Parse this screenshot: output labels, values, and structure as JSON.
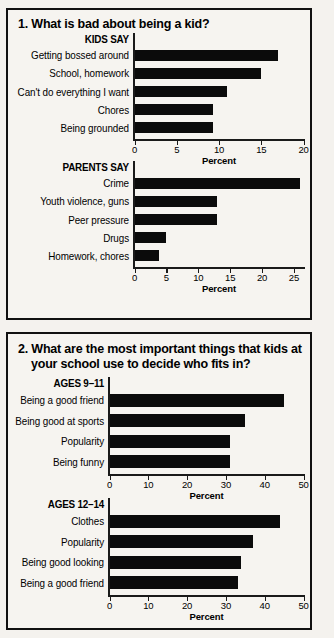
{
  "panels": [
    {
      "id": "panel-1",
      "title": "1. What is bad about being a kid?",
      "title_line2": "",
      "charts": [
        {
          "group": "KIDS SAY",
          "xlabel": "Percent",
          "ticks": [
            "0",
            "5",
            "10",
            "15",
            "20"
          ],
          "xmax": 20,
          "bars": [
            {
              "label": "Getting bossed around",
              "value": 17
            },
            {
              "label": "School, homework",
              "value": 15
            },
            {
              "label": "Can't do everything I want",
              "value": 11
            },
            {
              "label": "Chores",
              "value": 9.3
            },
            {
              "label": "Being grounded",
              "value": 9.3
            }
          ]
        },
        {
          "group": "PARENTS SAY",
          "xlabel": "Percent",
          "ticks": [
            "0",
            "5",
            "10",
            "15",
            "20",
            "25"
          ],
          "xmax": 26.5,
          "bars": [
            {
              "label": "Crime",
              "value": 26
            },
            {
              "label": "Youth violence, guns",
              "value": 13
            },
            {
              "label": "Peer pressure",
              "value": 13
            },
            {
              "label": "Drugs",
              "value": 5
            },
            {
              "label": "Homework, chores",
              "value": 3.8
            }
          ]
        }
      ]
    },
    {
      "id": "panel-2",
      "title": "2. What are the most important things that kids at",
      "title_line2": "your school use to decide who fits in?",
      "charts": [
        {
          "group": "AGES 9–11",
          "xlabel": "Percent",
          "ticks": [
            "0",
            "10",
            "20",
            "30",
            "40",
            "50"
          ],
          "xmax": 50,
          "bars": [
            {
              "label": "Being a good friend",
              "value": 45
            },
            {
              "label": "Being good at sports",
              "value": 35
            },
            {
              "label": "Popularity",
              "value": 31
            },
            {
              "label": "Being funny",
              "value": 31
            }
          ]
        },
        {
          "group": "AGES 12–14",
          "xlabel": "Percent",
          "ticks": [
            "0",
            "10",
            "20",
            "30",
            "40",
            "50"
          ],
          "xmax": 50,
          "bars": [
            {
              "label": "Clothes",
              "value": 44
            },
            {
              "label": "Popularity",
              "value": 37
            },
            {
              "label": "Being good looking",
              "value": 34
            },
            {
              "label": "Being a good friend",
              "value": 33
            }
          ]
        }
      ]
    }
  ],
  "chart_data": [
    {
      "type": "bar",
      "orientation": "horizontal",
      "title": "1. What is bad about being a kid? — KIDS SAY",
      "categories": [
        "Getting bossed around",
        "School, homework",
        "Can't do everything I want",
        "Chores",
        "Being grounded"
      ],
      "values": [
        17,
        15,
        11,
        9.3,
        9.3
      ],
      "xlabel": "Percent",
      "ylabel": "",
      "xlim": [
        0,
        20
      ],
      "xticks": [
        0,
        5,
        10,
        15,
        20
      ],
      "grid": false,
      "legend": "none"
    },
    {
      "type": "bar",
      "orientation": "horizontal",
      "title": "1. What is bad about being a kid? — PARENTS SAY",
      "categories": [
        "Crime",
        "Youth violence, guns",
        "Peer pressure",
        "Drugs",
        "Homework, chores"
      ],
      "values": [
        26,
        13,
        13,
        5,
        3.8
      ],
      "xlabel": "Percent",
      "ylabel": "",
      "xlim": [
        0,
        26.5
      ],
      "xticks": [
        0,
        5,
        10,
        15,
        20,
        25
      ],
      "grid": false,
      "legend": "none"
    },
    {
      "type": "bar",
      "orientation": "horizontal",
      "title": "2. What are the most important things that kids at your school use to decide who fits in? — AGES 9–11",
      "categories": [
        "Being a good friend",
        "Being good at sports",
        "Popularity",
        "Being funny"
      ],
      "values": [
        45,
        35,
        31,
        31
      ],
      "xlabel": "Percent",
      "ylabel": "",
      "xlim": [
        0,
        50
      ],
      "xticks": [
        0,
        10,
        20,
        30,
        40,
        50
      ],
      "grid": false,
      "legend": "none"
    },
    {
      "type": "bar",
      "orientation": "horizontal",
      "title": "2. What are the most important things that kids at your school use to decide who fits in? — AGES 12–14",
      "categories": [
        "Clothes",
        "Popularity",
        "Being good looking",
        "Being a good friend"
      ],
      "values": [
        44,
        37,
        34,
        33
      ],
      "xlabel": "Percent",
      "ylabel": "",
      "xlim": [
        0,
        50
      ],
      "xticks": [
        0,
        10,
        20,
        30,
        40,
        50
      ],
      "grid": false,
      "legend": "none"
    }
  ],
  "colors": {
    "bar": "#0b0b0b",
    "axis": "#1a1a1a",
    "border": "#111111",
    "background": "#f4f2ee"
  }
}
